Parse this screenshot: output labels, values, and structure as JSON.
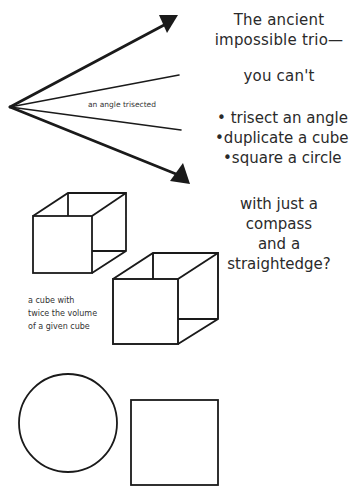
{
  "heading": {
    "line1": "The ancient",
    "line2": "impossible trio—",
    "line3": "you can't"
  },
  "problems": [
    {
      "bullet": "•",
      "text": "trisect an angle"
    },
    {
      "bullet": "•",
      "text": "duplicate a cube"
    },
    {
      "bullet": "•",
      "text": "square a circle"
    }
  ],
  "closing": {
    "line1": "with just a",
    "line2": "compass",
    "line3": "and a",
    "line4": "straightedge?"
  },
  "labels": {
    "angle": "an angle trisected",
    "cube_line1": "a cube with",
    "cube_line2": "twice the volume",
    "cube_line3": "of a given cube"
  },
  "colors": {
    "stroke": "#1a1a1a",
    "background": "#ffffff"
  }
}
